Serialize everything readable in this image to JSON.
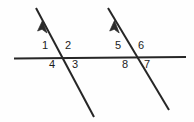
{
  "figure": {
    "name": "two-parallel-transversals-cut-by-line",
    "background_color": "#fefefe",
    "stroke_color": "#262626",
    "label_color": "#1c1c1c"
  },
  "lines": [
    {
      "id": "horizontal-line",
      "role": "transversal-horizontal",
      "x1": 14,
      "y1": 58.5,
      "x2": 186,
      "y2": 57.0,
      "stroke_width": 1.9,
      "arrow": false
    },
    {
      "id": "left-slanted-line",
      "role": "parallel-line-left",
      "x1": 36,
      "y1": 8,
      "x2": 94,
      "y2": 117,
      "stroke_width": 2.0,
      "arrow": true,
      "arrow_at": "top",
      "arrow_tip_x": 42.5,
      "arrow_tip_y": 20.5
    },
    {
      "id": "right-slanted-line",
      "role": "parallel-line-right",
      "x1": 108,
      "y1": 8,
      "x2": 169,
      "y2": 110,
      "stroke_width": 2.0,
      "arrow": true,
      "arrow_at": "top",
      "arrow_tip_x": 114.5,
      "arrow_tip_y": 20.5
    }
  ],
  "intersections": [
    {
      "id": "left-intersection",
      "x": 62,
      "y": 58
    },
    {
      "id": "right-intersection",
      "x": 135,
      "y": 57.5
    }
  ],
  "angle_labels": [
    {
      "id": "angle-1",
      "text": "1",
      "x": 45,
      "y": 45,
      "quadrant": "upper-left",
      "intersection": "left-intersection"
    },
    {
      "id": "angle-2",
      "text": "2",
      "x": 68,
      "y": 45,
      "quadrant": "upper-right",
      "intersection": "left-intersection"
    },
    {
      "id": "angle-3",
      "text": "3",
      "x": 75,
      "y": 62,
      "quadrant": "lower-right",
      "intersection": "left-intersection"
    },
    {
      "id": "angle-4",
      "text": "4",
      "x": 52,
      "y": 62,
      "quadrant": "lower-left",
      "intersection": "left-intersection"
    },
    {
      "id": "angle-5",
      "text": "5",
      "x": 118,
      "y": 45,
      "quadrant": "upper-left",
      "intersection": "right-intersection"
    },
    {
      "id": "angle-6",
      "text": "6",
      "x": 141,
      "y": 45,
      "quadrant": "upper-right",
      "intersection": "right-intersection"
    },
    {
      "id": "angle-7",
      "text": "7",
      "x": 147,
      "y": 62,
      "quadrant": "lower-right",
      "intersection": "right-intersection"
    },
    {
      "id": "angle-8",
      "text": "8",
      "x": 125,
      "y": 62,
      "quadrant": "lower-left",
      "intersection": "right-intersection"
    }
  ]
}
